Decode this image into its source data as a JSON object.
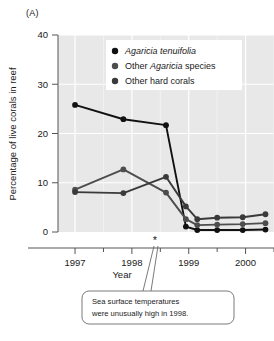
{
  "figure": {
    "panel_label": "(A)",
    "background_color": "#ffffff",
    "plot_background_color": "#e8e8e8",
    "gridline_color": "#ffffff",
    "axis_color": "#555555"
  },
  "chart_data": {
    "type": "line",
    "title": "",
    "xlabel": "Year",
    "ylabel": "Percentage of live corals in reef",
    "xlim": [
      1996.7,
      2000.5
    ],
    "ylim": [
      0,
      40
    ],
    "yticks": [
      0,
      10,
      20,
      30,
      40
    ],
    "ytick_labels": [
      "0",
      "10",
      "20",
      "30",
      "40"
    ],
    "xticks": [
      1997,
      1998,
      1999,
      2000
    ],
    "xtick_labels": [
      "1997",
      "1998",
      "1999",
      "2000"
    ],
    "minor_xticks": [
      1997.5,
      1998.5,
      1999.5,
      2000.5
    ],
    "grid": true,
    "legend_position": "top-right",
    "series": [
      {
        "name": "Agaricia tenuifolia",
        "italic": true,
        "color": "#111111",
        "x": [
          1997.0,
          1997.85,
          1998.6,
          1998.95,
          1999.15,
          1999.5,
          1999.95,
          2000.35
        ],
        "y": [
          25.8,
          22.9,
          21.7,
          1.1,
          0.4,
          0.4,
          0.4,
          0.5
        ]
      },
      {
        "name": "Other Agaricia species",
        "italic_word": "Agaricia",
        "color": "#4d4d4d",
        "x": [
          1997.0,
          1997.85,
          1998.6,
          1998.95,
          1999.15,
          1999.5,
          1999.95,
          2000.35
        ],
        "y": [
          8.6,
          12.7,
          8.0,
          2.6,
          1.4,
          1.5,
          1.6,
          1.8
        ]
      },
      {
        "name": "Other hard corals",
        "color": "#3a3a3a",
        "x": [
          1997.0,
          1997.85,
          1998.6,
          1998.95,
          1999.15,
          1999.5,
          1999.95,
          2000.35
        ],
        "y": [
          8.1,
          7.9,
          11.2,
          5.2,
          2.6,
          2.9,
          3.0,
          3.6
        ]
      }
    ],
    "annotations": [
      {
        "name": "asterisk-marker",
        "symbol": "*",
        "x": 1998.72,
        "text": ""
      },
      {
        "name": "callout",
        "line1": "Sea surface temperatures",
        "line2": "were unusually high in 1998."
      }
    ]
  },
  "legend": {
    "items": [
      {
        "label_parts": [
          {
            "t": "Agaricia tenuifolia",
            "italic": true
          }
        ]
      },
      {
        "label_parts": [
          {
            "t": "Other ",
            "italic": false
          },
          {
            "t": "Agaricia",
            "italic": true
          },
          {
            "t": " species",
            "italic": false
          }
        ]
      },
      {
        "label_parts": [
          {
            "t": "Other hard corals",
            "italic": false
          }
        ]
      }
    ],
    "labels": [
      "Agaricia tenuifolia",
      "Other Agaricia species",
      "Other hard corals"
    ]
  }
}
